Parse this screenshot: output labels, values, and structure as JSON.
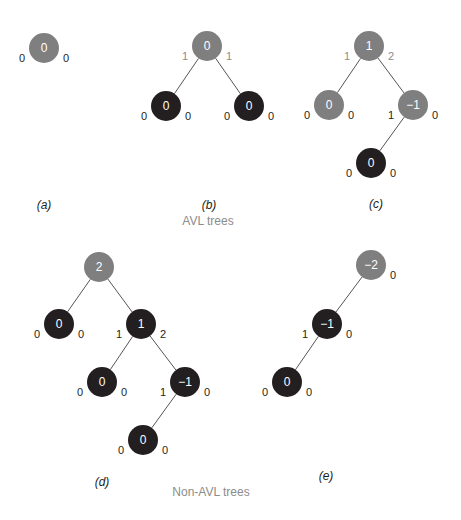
{
  "colors": {
    "unbalanced_node": "#7f7f7f",
    "balanced_node": "#231f20",
    "node_text": "#ffffff",
    "label_dark": "#231f20",
    "label_gray": "#8c8c8c",
    "edge": "#555555"
  },
  "groups": [
    {
      "label": "AVL trees",
      "trees": [
        "a",
        "b",
        "c"
      ]
    },
    {
      "label": "Non-AVL trees",
      "trees": [
        "d",
        "e"
      ]
    }
  ],
  "trees": [
    {
      "id": "a",
      "caption": "(a)",
      "nodes": [
        {
          "id": "a-root",
          "balance": "0",
          "style": "gray",
          "left_height": "0",
          "right_height": "0",
          "height_style": "dark"
        }
      ],
      "edges": []
    },
    {
      "id": "b",
      "caption": "(b)",
      "nodes": [
        {
          "id": "b-root",
          "balance": "0",
          "style": "gray",
          "left_height": "1",
          "right_height": "1",
          "height_style": "gray"
        },
        {
          "id": "b-left",
          "balance": "0",
          "style": "dark",
          "left_height": "0",
          "right_height": "0",
          "height_style": "dark"
        },
        {
          "id": "b-right",
          "balance": "0",
          "style": "dark",
          "left_height": "0",
          "right_height": "0",
          "height_style": "dark"
        }
      ],
      "edges": [
        [
          "b-root",
          "b-left"
        ],
        [
          "b-root",
          "b-right"
        ]
      ]
    },
    {
      "id": "c",
      "caption": "(c)",
      "nodes": [
        {
          "id": "c-root",
          "balance": "1",
          "style": "gray",
          "left_height": "1",
          "right_height": "2",
          "height_style": "gray"
        },
        {
          "id": "c-left",
          "balance": "0",
          "style": "gray",
          "left_height": "0",
          "right_height": "0",
          "height_style": "dark"
        },
        {
          "id": "c-right",
          "balance": "−1",
          "style": "gray",
          "left_height": "1",
          "right_height": "0",
          "height_style": "dark"
        },
        {
          "id": "c-right-left",
          "balance": "0",
          "style": "dark",
          "left_height": "0",
          "right_height": "0",
          "height_style": "dark"
        }
      ],
      "edges": [
        [
          "c-root",
          "c-left"
        ],
        [
          "c-root",
          "c-right"
        ],
        [
          "c-right",
          "c-right-left"
        ]
      ]
    },
    {
      "id": "d",
      "caption": "(d)",
      "nodes": [
        {
          "id": "d-root",
          "balance": "2",
          "style": "gray",
          "left_height": "",
          "right_height": "",
          "height_style": "gray"
        },
        {
          "id": "d-left",
          "balance": "0",
          "style": "dark",
          "left_height": "0",
          "right_height": "0",
          "height_style": "dark"
        },
        {
          "id": "d-right",
          "balance": "1",
          "style": "dark",
          "left_height": "1",
          "right_height": "2",
          "height_style": "dark"
        },
        {
          "id": "d-right-left",
          "balance": "0",
          "style": "dark",
          "left_height": "0",
          "right_height": "0",
          "height_style": "dark"
        },
        {
          "id": "d-right-right",
          "balance": "−1",
          "style": "dark",
          "left_height": "1",
          "right_height": "0",
          "height_style": "dark"
        },
        {
          "id": "d-rr-left",
          "balance": "0",
          "style": "dark",
          "left_height": "0",
          "right_height": "0",
          "height_style": "dark"
        }
      ],
      "edges": [
        [
          "d-root",
          "d-left"
        ],
        [
          "d-root",
          "d-right"
        ],
        [
          "d-right",
          "d-right-left"
        ],
        [
          "d-right",
          "d-right-right"
        ],
        [
          "d-right-right",
          "d-rr-left"
        ]
      ]
    },
    {
      "id": "e",
      "caption": "(e)",
      "nodes": [
        {
          "id": "e-root",
          "balance": "−2",
          "style": "gray",
          "left_height": "",
          "right_height": "0",
          "height_style": "dark"
        },
        {
          "id": "e-left",
          "balance": "−1",
          "style": "dark",
          "left_height": "1",
          "right_height": "0",
          "height_style": "dark"
        },
        {
          "id": "e-left-left",
          "balance": "0",
          "style": "dark",
          "left_height": "0",
          "right_height": "0",
          "height_style": "dark"
        }
      ],
      "edges": [
        [
          "e-root",
          "e-left"
        ],
        [
          "e-left",
          "e-left-left"
        ]
      ]
    }
  ]
}
